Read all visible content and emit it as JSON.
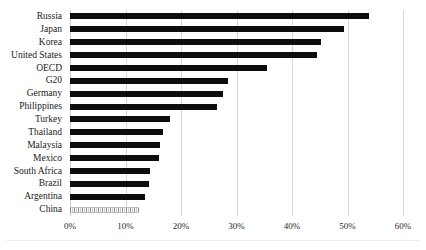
{
  "chart_data": {
    "type": "bar",
    "orientation": "horizontal",
    "title": "",
    "xlabel": "",
    "ylabel": "",
    "xlim": [
      0,
      60
    ],
    "xtick_labels": [
      "0%",
      "10%",
      "20%",
      "30%",
      "40%",
      "50%",
      "60%"
    ],
    "xticks": [
      0,
      10,
      20,
      30,
      40,
      50,
      60
    ],
    "grid": true,
    "legend": false,
    "value_unit": "%",
    "categories": [
      "Russia",
      "Japan",
      "Korea",
      "United States",
      "OECD",
      "G20",
      "Germany",
      "Philippines",
      "Turkey",
      "Thailand",
      "Malaysia",
      "Mexico",
      "South Africa",
      "Brazil",
      "Argentina",
      "China"
    ],
    "values": [
      53.8,
      49.3,
      45.2,
      44.5,
      35.5,
      28.5,
      27.5,
      26.5,
      18.0,
      16.8,
      16.2,
      16.1,
      14.4,
      14.2,
      13.6,
      12.5
    ],
    "series": [
      {
        "name": "Share",
        "values": [
          53.8,
          49.3,
          45.2,
          44.5,
          35.5,
          28.5,
          27.5,
          26.5,
          18.0,
          16.8,
          16.2,
          16.1,
          14.4,
          14.2,
          13.6,
          12.5
        ]
      }
    ],
    "bar_styles": [
      "solid",
      "solid",
      "solid",
      "solid",
      "solid",
      "solid",
      "solid",
      "solid",
      "solid",
      "solid",
      "solid",
      "solid",
      "solid",
      "solid",
      "solid",
      "hatched"
    ],
    "colors": {
      "bar": "#0d0d0d",
      "bar_hatched": "#8a8a8a",
      "gridline": "#d8d8da",
      "text": "#1a1a1a",
      "background": "#ffffff"
    }
  }
}
